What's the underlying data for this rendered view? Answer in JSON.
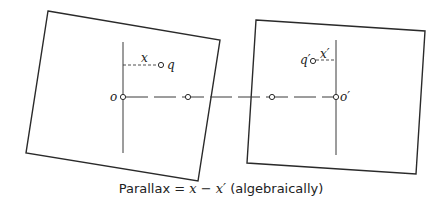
{
  "diagram": {
    "type": "stereo-parallax",
    "left_photo": {
      "corners": [
        [
          48,
          11
        ],
        [
          220,
          40
        ],
        [
          198,
          181
        ],
        [
          26,
          153
        ]
      ],
      "principal_point": {
        "label": "o",
        "x": 123,
        "y": 97
      },
      "conjugate_principal_point": {
        "x": 188,
        "y": 97
      },
      "image_point": {
        "label": "q",
        "x": 161,
        "y": 65
      },
      "distance_label": "x",
      "vertical_axis": {
        "x": 123,
        "y1": 42,
        "y2": 153
      }
    },
    "right_photo": {
      "corners": [
        [
          256,
          20
        ],
        [
          425,
          31
        ],
        [
          416,
          174
        ],
        [
          247,
          163
        ]
      ],
      "principal_point": {
        "label": "o′",
        "x": 336,
        "y": 97
      },
      "conjugate_principal_point": {
        "x": 272,
        "y": 97
      },
      "image_point": {
        "label": "q′",
        "x": 313,
        "y": 61
      },
      "distance_label": "x′",
      "vertical_axis": {
        "x": 336,
        "y1": 40,
        "y2": 155
      }
    },
    "flight_line": {
      "y": 97,
      "x1": 123,
      "x2": 336
    },
    "caption": {
      "prefix": "Parallax = ",
      "formula": "x − x′",
      "suffix": " (algebraically)"
    }
  },
  "labels": {
    "o": "o",
    "q": "q",
    "x": "x",
    "o_prime": "o′",
    "q_prime": "q′",
    "x_prime": "x′"
  }
}
